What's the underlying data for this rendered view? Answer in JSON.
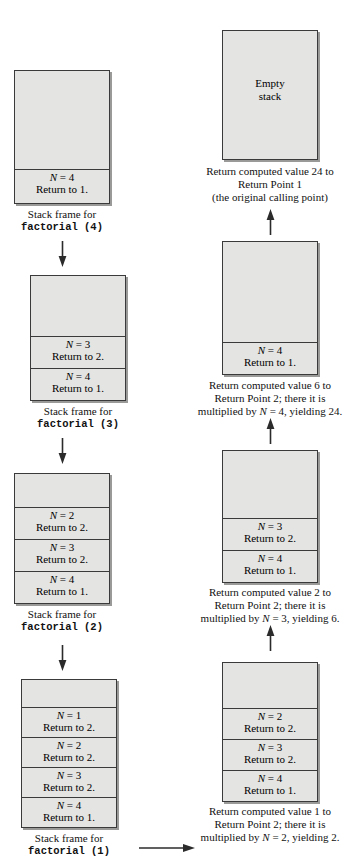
{
  "diagram": {
    "colors": {
      "box_fill": "#e4e4e2",
      "box_border": "#3a3a3a",
      "shadow": "#9a9a98",
      "background": "#ffffff"
    },
    "left_column": {
      "label": "Stack growing (calls)",
      "frames": [
        {
          "caption_line1": "Stack frame for",
          "caption_line2": "factorial (4)",
          "cells": [
            {
              "n_label": "N",
              "n_value": "= 4",
              "return_text": "Return to 1."
            }
          ]
        },
        {
          "caption_line1": "Stack frame for",
          "caption_line2": "factorial (3)",
          "cells": [
            {
              "n_label": "N",
              "n_value": "= 3",
              "return_text": "Return to 2."
            },
            {
              "n_label": "N",
              "n_value": "= 4",
              "return_text": "Return to 1."
            }
          ]
        },
        {
          "caption_line1": "Stack frame for",
          "caption_line2": "factorial (2)",
          "cells": [
            {
              "n_label": "N",
              "n_value": "= 2",
              "return_text": "Return to 2."
            },
            {
              "n_label": "N",
              "n_value": "= 3",
              "return_text": "Return to 2."
            },
            {
              "n_label": "N",
              "n_value": "= 4",
              "return_text": "Return to 1."
            }
          ]
        },
        {
          "caption_line1": "Stack frame for",
          "caption_line2": "factorial (1)",
          "cells": [
            {
              "n_label": "N",
              "n_value": "= 1",
              "return_text": "Return to 2."
            },
            {
              "n_label": "N",
              "n_value": "= 2",
              "return_text": "Return to 2."
            },
            {
              "n_label": "N",
              "n_value": "= 3",
              "return_text": "Return to 2."
            },
            {
              "n_label": "N",
              "n_value": "= 4",
              "return_text": "Return to 1."
            }
          ]
        }
      ]
    },
    "right_column": {
      "label": "Stack unwinding (returns)",
      "frames": [
        {
          "empty_label_line1": "Empty",
          "empty_label_line2": "stack",
          "caption_line1": "Return computed value 24 to",
          "caption_line2": "Return Point 1",
          "caption_line3": "(the original calling point)",
          "cells": []
        },
        {
          "caption_line1": "Return computed value 6 to",
          "caption_line2": "Return Point 2; there it is",
          "caption_line3_pre": "multiplied by ",
          "caption_line3_it": "N",
          "caption_line3_post": " = 4, yielding 24.",
          "cells": [
            {
              "n_label": "N",
              "n_value": "= 4",
              "return_text": "Return to 1."
            }
          ]
        },
        {
          "caption_line1": "Return computed value 2 to",
          "caption_line2": "Return Point 2; there it is",
          "caption_line3_pre": "multiplied by ",
          "caption_line3_it": "N",
          "caption_line3_post": " = 3, yielding 6.",
          "cells": [
            {
              "n_label": "N",
              "n_value": "= 3",
              "return_text": "Return to 2."
            },
            {
              "n_label": "N",
              "n_value": "= 4",
              "return_text": "Return to 1."
            }
          ]
        },
        {
          "caption_line1": "Return computed value 1 to",
          "caption_line2": "Return Point 2; there it is",
          "caption_line3_pre": "multiplied by ",
          "caption_line3_it": "N",
          "caption_line3_post": " = 2, yielding 2.",
          "cells": [
            {
              "n_label": "N",
              "n_value": "= 2",
              "return_text": "Return to 2."
            },
            {
              "n_label": "N",
              "n_value": "= 3",
              "return_text": "Return to 2."
            },
            {
              "n_label": "N",
              "n_value": "= 4",
              "return_text": "Return to 1."
            }
          ]
        }
      ]
    },
    "arrows": {
      "down_icon": "arrow-down-icon",
      "up_icon": "arrow-up-icon",
      "right_icon": "arrow-right-icon"
    }
  }
}
